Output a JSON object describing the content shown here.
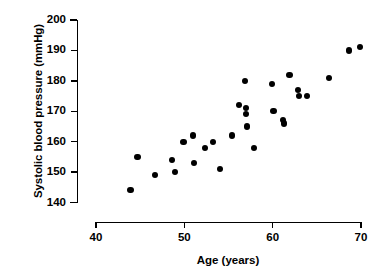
{
  "chart_data": {
    "type": "scatter",
    "title": "",
    "xlabel": "Age (years)",
    "ylabel": "Systolic blood pressure (mmHg)",
    "xlim": [
      40,
      70
    ],
    "ylim": [
      140,
      200
    ],
    "xticks": [
      40,
      50,
      60,
      70
    ],
    "yticks": [
      140,
      150,
      160,
      170,
      180,
      190,
      200
    ],
    "xtick_labels": [
      "40",
      "50",
      "60",
      "70"
    ],
    "ytick_labels": [
      "140",
      "150",
      "160",
      "170",
      "180",
      "190",
      "200"
    ],
    "grid": false,
    "legend": null,
    "marker": {
      "shape": "circle",
      "color": "#000000",
      "size": 6
    },
    "n_points": 36,
    "x": [
      43.9,
      44.7,
      46.7,
      48.6,
      48.9,
      49.9,
      50.1,
      51.1,
      51.4,
      52.3,
      53.2,
      54.0,
      55.4,
      56.2,
      56.8,
      56.9,
      57.0,
      57.0,
      57.1,
      57.9,
      59.9,
      60.0,
      61.2,
      61.3,
      61.9,
      62.9,
      63.0,
      63.9,
      66.4,
      68.6,
      69.9
    ],
    "y": [
      144,
      155,
      149,
      154,
      150,
      160,
      162,
      153,
      158,
      160,
      151,
      162,
      172,
      180,
      171,
      169,
      165,
      179,
      170,
      158,
      167,
      166,
      182,
      177,
      175,
      175,
      181,
      190,
      191,
      176,
      160
    ],
    "points": [
      {
        "age": 43.9,
        "bp": 144
      },
      {
        "age": 44.7,
        "bp": 155
      },
      {
        "age": 46.7,
        "bp": 149
      },
      {
        "age": 48.6,
        "bp": 154
      },
      {
        "age": 48.9,
        "bp": 150
      },
      {
        "age": 49.9,
        "bp": 160
      },
      {
        "age": 51.0,
        "bp": 162
      },
      {
        "age": 51.1,
        "bp": 153
      },
      {
        "age": 52.3,
        "bp": 158
      },
      {
        "age": 53.2,
        "bp": 160
      },
      {
        "age": 54.0,
        "bp": 151
      },
      {
        "age": 55.4,
        "bp": 162
      },
      {
        "age": 56.2,
        "bp": 172
      },
      {
        "age": 56.9,
        "bp": 180
      },
      {
        "age": 57.0,
        "bp": 171
      },
      {
        "age": 57.0,
        "bp": 169
      },
      {
        "age": 57.1,
        "bp": 165
      },
      {
        "age": 57.9,
        "bp": 158
      },
      {
        "age": 59.9,
        "bp": 179
      },
      {
        "age": 60.1,
        "bp": 170
      },
      {
        "age": 61.2,
        "bp": 167
      },
      {
        "age": 61.3,
        "bp": 166
      },
      {
        "age": 61.9,
        "bp": 182
      },
      {
        "age": 62.9,
        "bp": 177
      },
      {
        "age": 63.0,
        "bp": 175
      },
      {
        "age": 63.9,
        "bp": 175
      },
      {
        "age": 66.4,
        "bp": 181
      },
      {
        "age": 68.6,
        "bp": 190
      },
      {
        "age": 69.9,
        "bp": 191
      }
    ]
  }
}
